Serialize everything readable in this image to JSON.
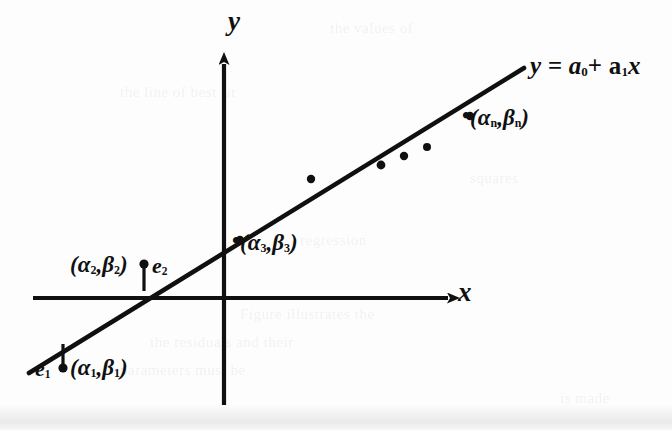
{
  "figure": {
    "kind": "least-squares-regression-diagram",
    "background_color": "#fdfdfd",
    "ink_color": "#101010",
    "axes": {
      "x_label": "x",
      "y_label": "y",
      "x_axis": {
        "x1": 33,
        "y1": 298,
        "x2": 452,
        "y2": 298,
        "arrow": "right"
      },
      "y_axis": {
        "x1": 224,
        "y1": 405,
        "x2": 224,
        "y2": 58,
        "arrow": "up"
      }
    },
    "fit_line": {
      "equation_text": "y = a",
      "equation_sub0": "0",
      "equation_plus": "+ a",
      "equation_sub1": "1",
      "equation_var": "x",
      "x1": 29,
      "y1": 373,
      "x2": 524,
      "y2": 68
    },
    "points": [
      {
        "name": "alpha-1",
        "cx": 63,
        "cy": 368,
        "r": 4.6,
        "labeled": true
      },
      {
        "name": "alpha-2",
        "cx": 144,
        "cy": 264,
        "r": 4.6,
        "labeled": true
      },
      {
        "name": "alpha-3",
        "cx": 240,
        "cy": 240,
        "r": 4.2,
        "labeled": true
      },
      {
        "name": "scatter-a",
        "cx": 311,
        "cy": 179,
        "r": 4.2,
        "labeled": false
      },
      {
        "name": "scatter-b",
        "cx": 381,
        "cy": 165,
        "r": 4.4,
        "labeled": false
      },
      {
        "name": "scatter-c",
        "cx": 404,
        "cy": 156,
        "r": 4.2,
        "labeled": false
      },
      {
        "name": "scatter-d",
        "cx": 427,
        "cy": 147,
        "r": 4.0,
        "labeled": false
      },
      {
        "name": "alpha-n",
        "cx": 470,
        "cy": 116,
        "r": 4.2,
        "labeled": true
      }
    ],
    "residuals": [
      {
        "name": "e1",
        "x": 63,
        "y_top": 344,
        "y_bottom": 368
      },
      {
        "name": "e2",
        "x": 144,
        "y_top": 264,
        "y_bottom": 291
      }
    ],
    "labels": {
      "point_1": {
        "open": "(",
        "alpha": "α",
        "sub_a": "1",
        "comma": ",",
        "beta": "β",
        "sub_b": "1",
        "close": ")"
      },
      "point_2": {
        "open": "(",
        "alpha": "α",
        "sub_a": "2",
        "comma": ",",
        "beta": "β",
        "sub_b": "2",
        "close": ")"
      },
      "point_3": {
        "open": "(",
        "alpha": "α",
        "sub_a": "3",
        "comma": ",",
        "beta": "β",
        "sub_b": "3",
        "close": ")"
      },
      "point_n": {
        "open": "(",
        "alpha": "α",
        "sub_a": "n",
        "comma": ",",
        "beta": "β",
        "sub_b": "n",
        "close": ")"
      },
      "error_1": {
        "letter": "e",
        "sub": "1"
      },
      "error_2": {
        "letter": "e",
        "sub": "2"
      },
      "dot_marker": "•"
    }
  },
  "scan_ghosts": [
    {
      "text": "the values of",
      "x": 330,
      "y": 20
    },
    {
      "text": "the line of best fit",
      "x": 120,
      "y": 84
    },
    {
      "text": "squares",
      "x": 470,
      "y": 170
    },
    {
      "text": "regression",
      "x": 300,
      "y": 232
    },
    {
      "text": "Figure  illustrates the",
      "x": 240,
      "y": 306
    },
    {
      "text": "the  residuals  and  their",
      "x": 150,
      "y": 334
    },
    {
      "text": "parameters  must  be",
      "x": 120,
      "y": 362
    },
    {
      "text": "is  made",
      "x": 560,
      "y": 390
    }
  ]
}
